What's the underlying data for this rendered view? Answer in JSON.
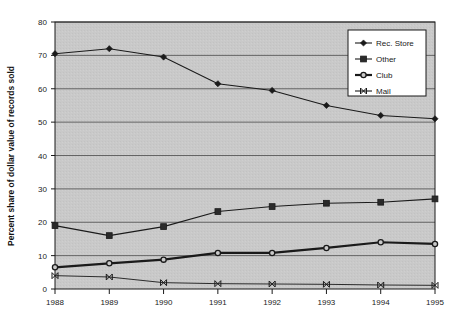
{
  "chart_data": {
    "type": "line",
    "title": "",
    "xlabel": "",
    "ylabel": "Percent share of dollar value of records sold",
    "categories": [
      "1988",
      "1989",
      "1990",
      "1991",
      "1992",
      "1993",
      "1994",
      "1995"
    ],
    "x": [
      1988,
      1989,
      1990,
      1991,
      1992,
      1993,
      1994,
      1995
    ],
    "xlim": [
      1988,
      1995
    ],
    "ylim": [
      0,
      80
    ],
    "ytick_labels": [
      "0",
      "10",
      "20",
      "30",
      "40",
      "50",
      "60",
      "70",
      "80"
    ],
    "ytick_values": [
      0,
      10,
      20,
      30,
      40,
      50,
      60,
      70,
      80
    ],
    "xtick_labels": [
      "1988",
      "1989",
      "1990",
      "1991",
      "1992",
      "1993",
      "1994",
      "1995"
    ],
    "grid": true,
    "legend_position": "upper right",
    "series": [
      {
        "name": "Rec. Store",
        "marker": "diamond",
        "values": [
          70.5,
          72.0,
          69.5,
          61.5,
          59.5,
          55.0,
          52.0,
          51.0
        ]
      },
      {
        "name": "Other",
        "marker": "square",
        "values": [
          19.0,
          16.0,
          18.7,
          23.2,
          24.7,
          25.7,
          26.0,
          27.0
        ]
      },
      {
        "name": "Club",
        "marker": "circle",
        "values": [
          6.5,
          7.7,
          8.8,
          10.8,
          10.8,
          12.3,
          14.0,
          13.5
        ]
      },
      {
        "name": "Mail",
        "marker": "x-bar",
        "values": [
          4.0,
          3.6,
          1.9,
          1.6,
          1.5,
          1.4,
          1.2,
          1.1
        ]
      }
    ]
  },
  "legend": {
    "entries": [
      {
        "label": "Rec. Store"
      },
      {
        "label": "Other"
      },
      {
        "label": "Club"
      },
      {
        "label": "Mail"
      }
    ]
  },
  "colors": {
    "plot_background": "#c9c9c9",
    "page_background": "#ffffff",
    "line": "#1a1a1a",
    "grid": "#4a4a4a",
    "legend_background": "#ffffff"
  }
}
